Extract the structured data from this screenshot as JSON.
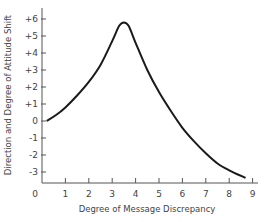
{
  "chart_data": {
    "type": "line",
    "title": "",
    "xlabel": "Degree of Message Discrepancy",
    "ylabel": "Direction and Degree of Attitude Shift",
    "xlim": [
      0,
      9
    ],
    "ylim": [
      -4,
      6.5
    ],
    "x_ticks": [
      "0",
      "1",
      "2",
      "3",
      "4",
      "5",
      "6",
      "7",
      "8",
      "9"
    ],
    "y_ticks": [
      "+6",
      "+5",
      "+4",
      "+3",
      "+2",
      "+1",
      "0",
      "-1",
      "-2",
      "-3"
    ],
    "grid": false,
    "legend": null,
    "series": [
      {
        "name": "Attitude shift",
        "x": [
          0.2,
          0.6,
          1.0,
          1.5,
          2.0,
          2.5,
          3.0,
          3.3,
          3.5,
          3.7,
          4.0,
          4.5,
          5.0,
          5.5,
          6.0,
          6.5,
          7.0,
          7.5,
          8.0,
          8.7
        ],
        "y": [
          0.0,
          0.35,
          0.8,
          1.5,
          2.3,
          3.3,
          4.7,
          5.6,
          5.8,
          5.6,
          4.6,
          3.0,
          1.7,
          0.6,
          -0.4,
          -1.2,
          -1.9,
          -2.5,
          -2.9,
          -3.35
        ]
      }
    ]
  }
}
